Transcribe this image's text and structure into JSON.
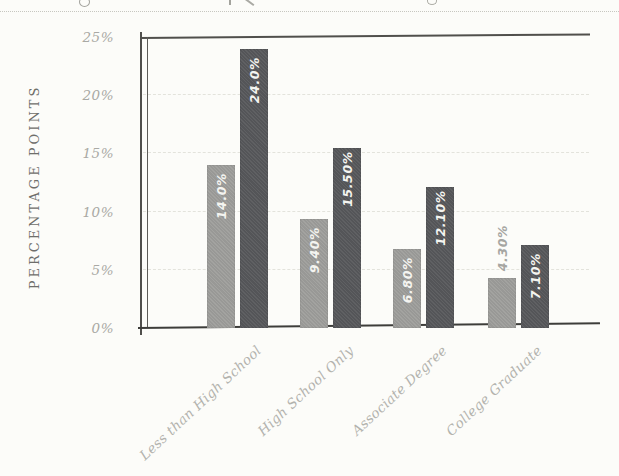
{
  "chart_data": {
    "type": "bar",
    "title": "",
    "xlabel": "",
    "ylabel": "PERCENTAGE POINTS",
    "ylim": [
      0,
      25
    ],
    "grid": "dashed-horizontal-every-5",
    "legend_position": "none",
    "yticks": [
      {
        "value": 0,
        "label": "0%"
      },
      {
        "value": 5,
        "label": "5%"
      },
      {
        "value": 10,
        "label": "10%"
      },
      {
        "value": 15,
        "label": "15%"
      },
      {
        "value": 20,
        "label": "20%"
      },
      {
        "value": 25,
        "label": "25%"
      }
    ],
    "categories": [
      "Less than High School",
      "High School Only",
      "Associate Degree",
      "College Graduate"
    ],
    "series": [
      {
        "name": "light-gray-bars",
        "color": "#9e9e9b",
        "values": [
          14.0,
          9.4,
          6.8,
          4.3
        ],
        "value_labels": [
          "14.0%",
          "9.40%",
          "6.80%",
          "4.30%"
        ]
      },
      {
        "name": "dark-gray-bars",
        "color": "#57585b",
        "values": [
          24.0,
          15.5,
          12.1,
          7.1
        ],
        "value_labels": [
          "24.0%",
          "15.50%",
          "12.10%",
          "7.10%"
        ]
      }
    ],
    "colors": {
      "bar_light": "#9e9e9b",
      "bar_dark": "#57585b",
      "label_inside": "#f4f4f0",
      "label_outside": "#a6a6a2",
      "tick_text": "#a9a9a4",
      "axis_title_text": "#6e6e6a",
      "axis_line": "#504f4c",
      "gridline": "#e3e3dc",
      "paper": "#fcfcf9"
    }
  }
}
